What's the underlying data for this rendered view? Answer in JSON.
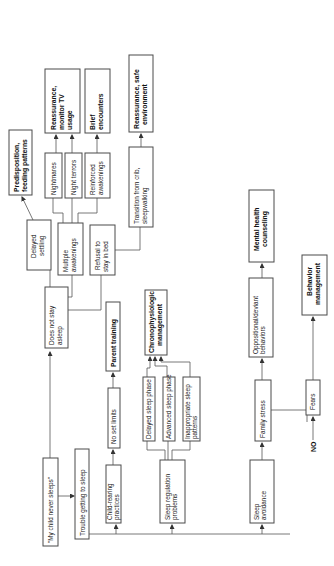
{
  "diagram": {
    "orientation": "rotated -90 degrees (reads bottom-to-top)",
    "root": {
      "line1": "\"My child never sleeps\""
    },
    "nodes": {
      "trouble_getting_to_sleep": {
        "line1": "Trouble getting to sleep"
      },
      "does_not_stay_asleep": {
        "line1": "Does not stay",
        "line2": "asleep"
      },
      "child_rearing_practices": {
        "line1": "Child-rearing",
        "line2": "practices"
      },
      "no_set_limits": {
        "line1": "No set limits"
      },
      "parent_training": {
        "line1": "Parent training"
      },
      "sleep_regulation_problems": {
        "line1": "Sleep regulation",
        "line2": "problems"
      },
      "delayed_sleep_phase": {
        "line1": "Delayed sleep phase"
      },
      "advanced_sleep_phase": {
        "line1": "Advanced sleep phase"
      },
      "inappropriate_sleep_patterns": {
        "line1": "Inappropriate sleep",
        "line2": "patterns"
      },
      "chronophysiologic_management": {
        "line1": "Chronophysiologic",
        "line2": "management"
      },
      "sleep_avoidance": {
        "line1": "Sleep",
        "line2": "avoidance"
      },
      "family_stress": {
        "line1": "Family stress"
      },
      "oppositional_deviant_behaviors": {
        "line1": "Oppositional/deviant",
        "line2": "behaviors"
      },
      "mental_health_counseling": {
        "line1": "Mental health",
        "line2": "counseling"
      },
      "no_label": {
        "line1": "NO"
      },
      "fears": {
        "line1": "Fears"
      },
      "behavior_management": {
        "line1": "Behavior",
        "line2": "management"
      },
      "delayed_settling": {
        "line1": "Delayed",
        "line2": "settling"
      },
      "multiple_awakenings": {
        "line1": "Multiple",
        "line2": "awakenings"
      },
      "refusal_to_stay_in_bed": {
        "line1": "Refusal to",
        "line2": "stay in bed"
      },
      "predisposition_feeding_patterns": {
        "line1": "Predisposition,",
        "line2": "feeding patterns"
      },
      "nightmares": {
        "line1": "Nightmares"
      },
      "night_terrors": {
        "line1": "Night terrors"
      },
      "reinforced_awakenings": {
        "line1": "Reinforced",
        "line2": "awakenings"
      },
      "reassurance_monitor_tv": {
        "line1": "Reassurance,",
        "line2": "monitor TV",
        "line3": "usage"
      },
      "brief_encounters": {
        "line1": "Brief",
        "line2": "encounters"
      },
      "transition_from_crib": {
        "line1": "Transition from crib,",
        "line2": "sleepwalking"
      },
      "reassurance_safe_environment": {
        "line1": "Reassurance, safe",
        "line2": "environment"
      }
    }
  }
}
